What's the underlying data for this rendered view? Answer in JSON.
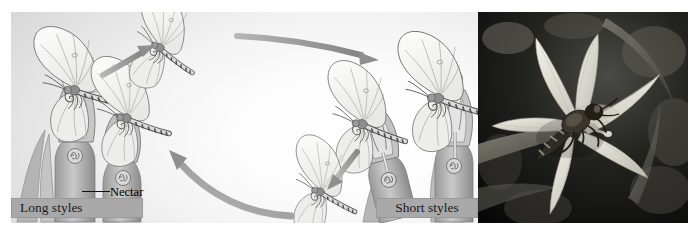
{
  "figure": {
    "kind": "pollination-cycle-diagram",
    "background_color": "#ffffff"
  },
  "illustration": {
    "name": "heterostyly-pollination-diagram",
    "background_gradient_from": "#c2c2c2",
    "background_gradient_to": "#ffffff",
    "labels": {
      "long_styles": "Long styles",
      "short_styles": "Short styles",
      "nectar": "Nectar"
    },
    "label_bar_color": "#a9a9a9",
    "label_text_color": "#1a1a1a",
    "arrows": [
      {
        "name": "arrow-long-flower-to-flight",
        "direction": "up-right",
        "description": "butterfly leaves long-styled flower",
        "color": "#8f8f8f"
      },
      {
        "name": "arrow-flight-to-short-flower",
        "direction": "right",
        "description": "butterfly travels to short-styled flower",
        "color": "#8f8f8f"
      },
      {
        "name": "arrow-short-flower-descend",
        "direction": "down-left",
        "description": "butterfly departs short-styled flower",
        "color": "#8f8f8f"
      },
      {
        "name": "arrow-return-to-long-flower",
        "direction": "up-left",
        "description": "butterfly returns to long-styled flower",
        "color": "#8f8f8f"
      }
    ],
    "butterflies": [
      {
        "name": "butterfly-on-long-style-flower",
        "state": "feeding"
      },
      {
        "name": "butterfly-in-flight-top",
        "state": "flying"
      },
      {
        "name": "butterfly-on-long-style-flower-lower",
        "state": "feeding"
      },
      {
        "name": "butterfly-in-flight-bottom",
        "state": "flying"
      },
      {
        "name": "butterfly-on-short-style-flower-left",
        "state": "feeding"
      },
      {
        "name": "butterfly-on-short-style-flower-right",
        "state": "feeding"
      }
    ],
    "flowers": [
      {
        "name": "flower-long-style-tall",
        "style_length": "long"
      },
      {
        "name": "flower-long-style-short",
        "style_length": "long"
      },
      {
        "name": "flower-short-style-left",
        "style_length": "short"
      },
      {
        "name": "flower-short-style-right",
        "style_length": "short"
      }
    ]
  },
  "photo": {
    "name": "crocus-flower-with-bee-photograph",
    "subject": "bee on open crocus flower",
    "tone": "black-and-white",
    "background_color": "#0b0b0b",
    "petal_color": "#e6e4dd",
    "insect_color": "#2a2722"
  }
}
